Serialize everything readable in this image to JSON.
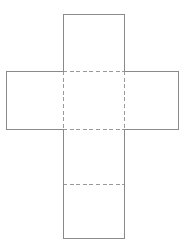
{
  "document": {
    "title": "Cube net diagram",
    "background_color": "#ffffff",
    "width": 185,
    "height": 247
  },
  "diagram": {
    "name": "cube-net",
    "solid_edge_color": "#8a8a8a",
    "dashed_edge_color": "#9a9a9a",
    "face_fill_color": "#ffffff",
    "stroke_width": 1,
    "dash_pattern": "4 2.6",
    "faces": [
      {
        "id": "top-face",
        "x": 63,
        "y": 14,
        "width": 61,
        "height": 57
      },
      {
        "id": "left-face",
        "x": 6,
        "y": 71,
        "width": 57,
        "height": 58
      },
      {
        "id": "center-face",
        "x": 63,
        "y": 71,
        "width": 61,
        "height": 58
      },
      {
        "id": "right-face",
        "x": 124,
        "y": 71,
        "width": 54,
        "height": 58
      },
      {
        "id": "lower-face",
        "x": 63,
        "y": 129,
        "width": 61,
        "height": 55
      },
      {
        "id": "bottom-face",
        "x": 63,
        "y": 184,
        "width": 61,
        "height": 54
      }
    ],
    "solid_edges": [
      {
        "id": "top-face-top",
        "x1": 63,
        "y1": 14,
        "x2": 124,
        "y2": 14
      },
      {
        "id": "top-face-left",
        "x1": 63,
        "y1": 14,
        "x2": 63,
        "y2": 71
      },
      {
        "id": "top-face-right",
        "x1": 124,
        "y1": 14,
        "x2": 124,
        "y2": 71
      },
      {
        "id": "left-face-top",
        "x1": 6,
        "y1": 71,
        "x2": 63,
        "y2": 71
      },
      {
        "id": "left-face-left",
        "x1": 6,
        "y1": 71,
        "x2": 6,
        "y2": 129
      },
      {
        "id": "left-face-bottom",
        "x1": 6,
        "y1": 129,
        "x2": 63,
        "y2": 129
      },
      {
        "id": "right-face-top",
        "x1": 124,
        "y1": 71,
        "x2": 178,
        "y2": 71
      },
      {
        "id": "right-face-right",
        "x1": 178,
        "y1": 71,
        "x2": 178,
        "y2": 129
      },
      {
        "id": "right-face-bottom",
        "x1": 124,
        "y1": 129,
        "x2": 178,
        "y2": 129
      },
      {
        "id": "lower-column-left",
        "x1": 63,
        "y1": 129,
        "x2": 63,
        "y2": 238
      },
      {
        "id": "lower-column-right",
        "x1": 124,
        "y1": 129,
        "x2": 124,
        "y2": 238
      },
      {
        "id": "bottom-face-bottom",
        "x1": 63,
        "y1": 238,
        "x2": 124,
        "y2": 238
      }
    ],
    "dashed_edges": [
      {
        "id": "fold-center-top",
        "x1": 63,
        "y1": 71,
        "x2": 124,
        "y2": 71
      },
      {
        "id": "fold-center-bottom",
        "x1": 63,
        "y1": 129,
        "x2": 124,
        "y2": 129
      },
      {
        "id": "fold-center-left",
        "x1": 63,
        "y1": 71,
        "x2": 63,
        "y2": 129
      },
      {
        "id": "fold-center-right",
        "x1": 124,
        "y1": 71,
        "x2": 124,
        "y2": 129
      },
      {
        "id": "fold-lower-divider",
        "x1": 63,
        "y1": 184,
        "x2": 124,
        "y2": 184
      }
    ]
  }
}
